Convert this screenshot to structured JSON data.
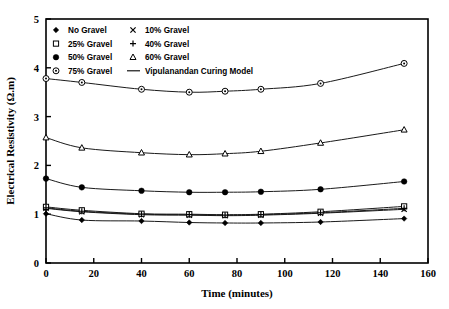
{
  "chart_data": {
    "type": "line",
    "title": "",
    "xlabel": "Time (minutes)",
    "ylabel": "Electrical Resistivity (Ω.m)",
    "xlim": [
      0,
      160
    ],
    "ylim": [
      0,
      5
    ],
    "xticks": [
      0,
      20,
      40,
      60,
      80,
      100,
      120,
      140,
      160
    ],
    "yticks": [
      0,
      1,
      2,
      3,
      4,
      5
    ],
    "grid": false,
    "legend_position": "top-left-inside",
    "x": [
      0,
      15,
      40,
      60,
      75,
      90,
      115,
      150
    ],
    "series": [
      {
        "name": "No Gravel",
        "marker": "filled-diamond",
        "values": [
          1.01,
          0.88,
          0.86,
          0.83,
          0.82,
          0.82,
          0.84,
          0.91
        ]
      },
      {
        "name": "10% Gravel",
        "marker": "cross-x",
        "values": [
          1.12,
          1.05,
          0.99,
          0.98,
          0.97,
          0.98,
          1.02,
          1.1
        ]
      },
      {
        "name": "25% Gravel",
        "marker": "open-square",
        "values": [
          1.15,
          1.08,
          1.01,
          1.0,
          0.99,
          1.0,
          1.05,
          1.16
        ]
      },
      {
        "name": "40% Gravel",
        "marker": "plus",
        "values": [
          1.13,
          1.06,
          1.0,
          0.99,
          0.98,
          0.99,
          1.03,
          1.12
        ]
      },
      {
        "name": "50% Gravel",
        "marker": "filled-circle",
        "values": [
          1.73,
          1.55,
          1.48,
          1.45,
          1.45,
          1.46,
          1.51,
          1.67
        ]
      },
      {
        "name": "60% Gravel",
        "marker": "open-triangle",
        "values": [
          2.57,
          2.36,
          2.26,
          2.22,
          2.24,
          2.29,
          2.46,
          2.73
        ]
      },
      {
        "name": "75% Gravel",
        "marker": "circle-dot",
        "values": [
          3.78,
          3.7,
          3.56,
          3.5,
          3.52,
          3.56,
          3.68,
          4.09
        ]
      }
    ],
    "model_curve": {
      "name": "Vipulanandan Curing Model",
      "style": "solid-line"
    }
  },
  "legend": {
    "items": [
      {
        "label": "No Gravel",
        "marker": "filled-diamond",
        "col": 0,
        "row": 0
      },
      {
        "label": "25% Gravel",
        "marker": "open-square",
        "col": 0,
        "row": 1
      },
      {
        "label": "50% Gravel",
        "marker": "filled-circle",
        "col": 0,
        "row": 2
      },
      {
        "label": "75% Gravel",
        "marker": "circle-dot",
        "col": 0,
        "row": 3
      },
      {
        "label": "10% Gravel",
        "marker": "cross-x",
        "col": 1,
        "row": 0
      },
      {
        "label": "40% Gravel",
        "marker": "plus",
        "col": 1,
        "row": 1
      },
      {
        "label": "60% Gravel",
        "marker": "open-triangle",
        "col": 1,
        "row": 2
      },
      {
        "label": "Vipulanandan Curing Model",
        "marker": "line",
        "col": 1,
        "row": 3
      }
    ]
  },
  "colors": {
    "axis": "#000000",
    "line": "#1a1a1a",
    "marker_fill": "#000000",
    "marker_open": "#ffffff",
    "background": "#ffffff"
  }
}
